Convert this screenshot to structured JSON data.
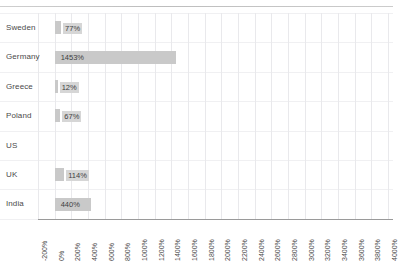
{
  "chart_data": {
    "type": "bar",
    "orientation": "horizontal",
    "title": "",
    "subtitle": "",
    "xlabel": "",
    "ylabel": "",
    "grid": true,
    "legend": false,
    "legend_position": "none",
    "categories": [
      "Sweden",
      "Germany",
      "Greece",
      "Poland",
      "US",
      "UK",
      "India"
    ],
    "values": [
      77,
      1453,
      12,
      67,
      null,
      114,
      440
    ],
    "data_labels": [
      "77%",
      "1453%",
      "12%",
      "67%",
      "",
      "114%",
      "440%"
    ],
    "xlim": [
      -200,
      4000
    ],
    "xtick_step": 200,
    "xticks": [
      "-200%",
      "0%",
      "200%",
      "400%",
      "600%",
      "800%",
      "1000%",
      "1200%",
      "1400%",
      "1600%",
      "1800%",
      "2000%",
      "2200%",
      "2400%",
      "2600%",
      "2800%",
      "3000%",
      "3200%",
      "3400%",
      "3600%",
      "3800%",
      "4000%"
    ],
    "bar_color": "#c9c9c9",
    "label_bg_color": "#d6d6d6",
    "gridline_color": "#e9e9ec",
    "axis_color": "#9a9a9a"
  }
}
